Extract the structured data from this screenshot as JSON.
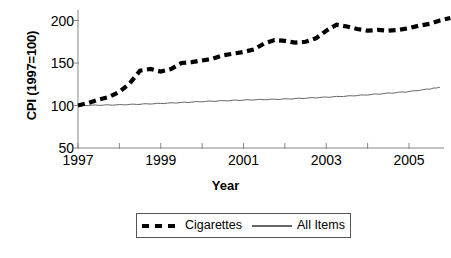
{
  "chart_data": {
    "type": "line",
    "title": "",
    "xlabel": "Year",
    "ylabel": "CPI (1997=100)",
    "xlim": [
      1997,
      2005.75
    ],
    "ylim": [
      50,
      210
    ],
    "grid": false,
    "legend_position": "bottom",
    "x_ticks_major": [
      "1997",
      "1999",
      "2001",
      "2003",
      "2005"
    ],
    "x_tick_values_major": [
      1997,
      1999,
      2001,
      2003,
      2005
    ],
    "x_tick_values_minor": [
      1998,
      2000,
      2002,
      2004
    ],
    "y_ticks": [
      "50",
      "100",
      "150",
      "200"
    ],
    "y_tick_values": [
      50,
      100,
      150,
      200
    ],
    "series": [
      {
        "name": "Cigarettes",
        "style": "dashed",
        "color": "#000000",
        "x": [
          1997.0,
          1997.25,
          1997.5,
          1997.75,
          1998.0,
          1998.25,
          1998.5,
          1998.75,
          1999.0,
          1999.25,
          1999.5,
          1999.75,
          2000.0,
          2000.25,
          2000.5,
          2000.75,
          2001.0,
          2001.25,
          2001.5,
          2001.75,
          2002.0,
          2002.25,
          2002.5,
          2002.75,
          2003.0,
          2003.25,
          2003.5,
          2003.75,
          2004.0,
          2004.25,
          2004.5,
          2004.75,
          2005.0,
          2005.25,
          2005.5
        ],
        "values": [
          100,
          103,
          107,
          110,
          116,
          126,
          141,
          143,
          140,
          143,
          150,
          151,
          153,
          155,
          159,
          161,
          163,
          166,
          173,
          177,
          176,
          174,
          175,
          179,
          188,
          195,
          193,
          190,
          188,
          189,
          188,
          189,
          191,
          194,
          196
        ]
      },
      {
        "name": "All Items",
        "style": "solid",
        "color": "#666666",
        "x": [
          1997.0,
          1997.5,
          1998.0,
          1998.5,
          1999.0,
          1999.5,
          2000.0,
          2000.5,
          2001.0,
          2001.5,
          2002.0,
          2002.5,
          2003.0,
          2003.5,
          2004.0,
          2004.5,
          2005.0,
          2005.5,
          2005.75
        ],
        "values": [
          100,
          100.4,
          100.8,
          101.6,
          102.4,
          103.5,
          104.6,
          105.6,
          106.4,
          107.0,
          107.6,
          108.6,
          109.8,
          111.0,
          112.6,
          114.4,
          116.4,
          119.5,
          121.5
        ]
      }
    ],
    "series_extra": {
      "cigarettes_tail_x": [
        2005.75,
        2006.0
      ],
      "cigarettes_tail_values": [
        200,
        203
      ]
    }
  },
  "axes": {
    "y_title": "CPI (1997=100)",
    "x_title": "Year"
  },
  "legend": {
    "entries": [
      {
        "label": "Cigarettes",
        "swatch": "dashed-line-swatch"
      },
      {
        "label": "All Items",
        "swatch": "solid-line-swatch"
      }
    ]
  }
}
